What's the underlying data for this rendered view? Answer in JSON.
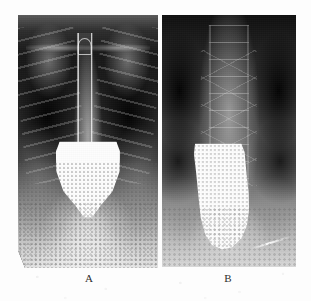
{
  "figure": {
    "caption_labels": [
      "A",
      "B"
    ],
    "background_color": "#fdfdfd",
    "panel_count": 2
  },
  "panel_a": {
    "label": "A",
    "modality": "radiograph",
    "view": "frontal chest",
    "description": "Frontal chest radiograph showing a narrow proximal contrast-filled esophageal column descending into a markedly dilated goblet-shaped esophagus with smooth distal tapering",
    "findings": [
      "dark lung fields bilaterally",
      "clavicles and upper ribs visible",
      "bright central mediastinal column",
      "dilated esophagus with bird-beak distal taper"
    ],
    "dark_tone": "#141414",
    "bright_tone": "#fdfdfd"
  },
  "panel_b": {
    "label": "B",
    "modality": "radiograph",
    "view": "frontal upper abdomen",
    "description": "Frontal abdominal radiograph showing a wider sigmoid sock-shaped contrast-filled column overlying the vertebral column",
    "findings": [
      "vertebral bodies with visible endplates",
      "dark paraspinal regions bilaterally",
      "dilated tortuous contrast-filled column",
      "bright linear artifact at lower right"
    ],
    "annotation_text": "",
    "dark_tone": "#101010",
    "bright_tone": "#fdfdfd"
  }
}
